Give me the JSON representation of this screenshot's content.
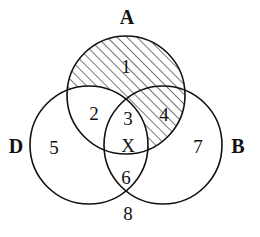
{
  "diagram": {
    "type": "venn-3-set",
    "background_color": "#ffffff",
    "stroke_color": "#111111",
    "hatch_color": "#111111",
    "stroke_width": 1.6,
    "hatch_angle_deg": 45,
    "hatch_spacing_px": 7,
    "sets": [
      {
        "id": "A",
        "label": "A",
        "cx": 126,
        "cy": 95,
        "r": 59,
        "label_x": 127,
        "label_y": 17
      },
      {
        "id": "D",
        "label": "D",
        "cx": 89,
        "cy": 145,
        "r": 59,
        "label_x": 16,
        "label_y": 146
      },
      {
        "id": "B",
        "label": "B",
        "cx": 163,
        "cy": 145,
        "r": 59,
        "label_x": 238,
        "label_y": 146
      }
    ],
    "regions": [
      {
        "id": "r1",
        "label": "1",
        "sets": "A only",
        "shaded": true,
        "x": 126,
        "y": 66
      },
      {
        "id": "r2",
        "label": "2",
        "sets": "A and D",
        "shaded": false,
        "x": 94,
        "y": 113
      },
      {
        "id": "r3",
        "label": "3",
        "sets": "A, B and D",
        "shaded": false,
        "x": 128,
        "y": 118
      },
      {
        "id": "rX",
        "label": "X",
        "sets": "A, B and D",
        "shaded": false,
        "x": 128,
        "y": 145
      },
      {
        "id": "r4",
        "label": "4",
        "sets": "A and B",
        "shaded": true,
        "x": 164,
        "y": 114
      },
      {
        "id": "r5",
        "label": "5",
        "sets": "D only",
        "shaded": false,
        "x": 54,
        "y": 147
      },
      {
        "id": "r6",
        "label": "6",
        "sets": "B and D",
        "shaded": false,
        "x": 126,
        "y": 177
      },
      {
        "id": "r7",
        "label": "7",
        "sets": "B only",
        "shaded": false,
        "x": 198,
        "y": 146
      },
      {
        "id": "r8",
        "label": "8",
        "sets": "outside all",
        "shaded": false,
        "x": 128,
        "y": 213
      }
    ]
  }
}
